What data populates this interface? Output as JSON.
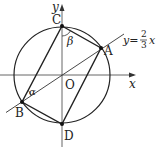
{
  "diagram": {
    "type": "geometry",
    "axes": {
      "x_label": "x",
      "y_label": "y",
      "origin_label": "O"
    },
    "line_label": {
      "lhs": "y=",
      "num": "2",
      "den": "3",
      "var": "x"
    },
    "points": {
      "A": "A",
      "B": "B",
      "C": "C",
      "D": "D"
    },
    "angles": {
      "alpha": "α",
      "beta": "β"
    },
    "colors": {
      "stroke": "#222222",
      "axis": "#555555",
      "background": "#ffffff"
    }
  }
}
